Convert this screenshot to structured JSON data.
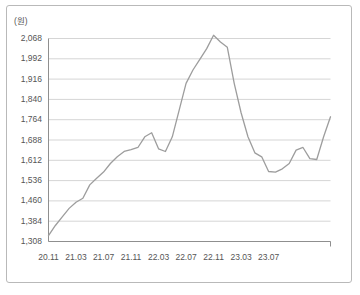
{
  "unit_label": "(원)",
  "colors": {
    "line": "#9d9d9d",
    "grid": "#d5d5d5",
    "axis": "#8f8f8f",
    "frame": "#b9b9b9",
    "text": "#555555",
    "background": "#ffffff"
  },
  "chart_data": {
    "type": "line",
    "title": "",
    "subtitle": "",
    "xlabel": "",
    "ylabel": "(원)",
    "ylim": [
      1308,
      2068
    ],
    "ytick_step": 76,
    "ytick_labels": [
      "1,308",
      "1,384",
      "1,460",
      "1,536",
      "1,612",
      "1,688",
      "1,764",
      "1,840",
      "1,916",
      "1,992",
      "2,068"
    ],
    "ytick_values": [
      1308,
      1384,
      1460,
      1536,
      1612,
      1688,
      1764,
      1840,
      1916,
      1992,
      2068
    ],
    "xtick_labels": [
      "20.11",
      "21.03",
      "21.07",
      "21.11",
      "22.03",
      "22.07",
      "22.11",
      "23.03",
      "23.07"
    ],
    "grid": true,
    "grid_axis": "y",
    "legend": false,
    "legend_position": "none",
    "x": [
      "20.11",
      "20.12",
      "21.01",
      "21.02",
      "21.03",
      "21.04",
      "21.05",
      "21.06",
      "21.07",
      "21.08",
      "21.09",
      "21.10",
      "21.11",
      "21.12",
      "22.01",
      "22.02",
      "22.03",
      "22.04",
      "22.05",
      "22.06",
      "22.07",
      "22.08",
      "22.09",
      "22.10",
      "22.11",
      "22.12",
      "23.01",
      "23.02",
      "23.03",
      "23.04",
      "23.05",
      "23.06",
      "23.07",
      "23.08",
      "23.09",
      "23.10"
    ],
    "series": [
      {
        "name": "가격",
        "values": [
          1330,
          1368,
          1400,
          1432,
          1455,
          1470,
          1520,
          1545,
          1568,
          1600,
          1625,
          1645,
          1652,
          1660,
          1700,
          1715,
          1655,
          1645,
          1700,
          1800,
          1900,
          1950,
          1990,
          2030,
          2080,
          2055,
          2035,
          1900,
          1790,
          1700,
          1640,
          1625,
          1570,
          1568,
          1580,
          1600
        ]
      }
    ],
    "series_tail": {
      "note": "continuation of the single series to the right edge",
      "x": [
        "23.11",
        "23.12",
        "24.01",
        "24.02",
        "24.03",
        "24.04"
      ],
      "values": [
        1650,
        1660,
        1618,
        1615,
        1700,
        1775
      ]
    }
  }
}
